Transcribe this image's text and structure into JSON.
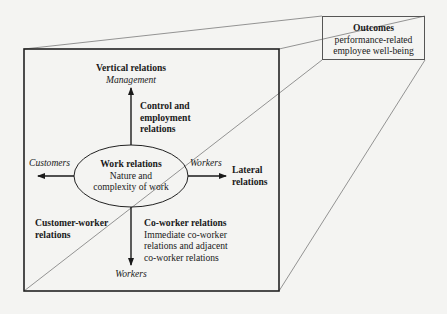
{
  "diagram": {
    "outcomes": {
      "title": "Outcomes",
      "line1": "performance-related",
      "line2": "employee well-being"
    },
    "vertical": {
      "title": "Vertical relations",
      "subtitle": "Management"
    },
    "control": {
      "line1": "Control and",
      "line2": "employment",
      "line3": "relations"
    },
    "center": {
      "title": "Work relations",
      "line1": "Nature and",
      "line2": "complexity of work"
    },
    "left_label": "Customers",
    "right_label": "Workers",
    "lateral": {
      "line1": "Lateral",
      "line2": "relations"
    },
    "customer_worker": {
      "line1": "Customer-worker",
      "line2": "relations"
    },
    "coworker": {
      "title": "Co-worker relations",
      "line1": "Immediate co-worker",
      "line2": "relations and adjacent",
      "line3": "co-worker relations"
    },
    "bottom_label": "Workers",
    "colors": {
      "background": "#f4f4f2",
      "frame": "#222222",
      "projection": "#777777"
    }
  }
}
